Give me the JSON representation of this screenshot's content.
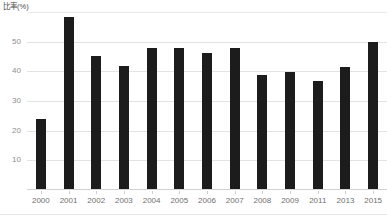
{
  "chart_data": {
    "type": "bar",
    "title": "",
    "subtitle": "",
    "xlabel": "",
    "ylabel": "比率(%)",
    "categories": [
      "2000",
      "2001",
      "2002",
      "2003",
      "2004",
      "2005",
      "2006",
      "2007",
      "2008",
      "2009",
      "2011",
      "2013",
      "2015"
    ],
    "values": [
      23.5,
      58.0,
      45.0,
      41.5,
      47.5,
      47.5,
      46.0,
      47.5,
      38.5,
      39.5,
      36.5,
      41.0,
      49.5
    ],
    "series": [
      {
        "name": "比率(%)",
        "values": [
          23.5,
          58.0,
          45.0,
          41.5,
          47.5,
          47.5,
          46.0,
          47.5,
          38.5,
          39.5,
          36.5,
          41.0,
          49.5
        ]
      }
    ],
    "ylim": [
      0,
      60
    ],
    "xlim": [
      0,
      13
    ],
    "y_ticks": [
      10,
      20,
      30,
      40,
      50
    ],
    "y_tick_labels": [
      "10",
      "20",
      "30",
      "40",
      "50"
    ],
    "grid": "horizontal",
    "legend": "none",
    "bar_color": "#1c1c1c",
    "gridline_color": "#e3e3e3",
    "background_color": "#ffffff",
    "annotations": []
  },
  "axis": {
    "y_title": "比率(%)",
    "y_ticks": [
      {
        "label": "50",
        "value": 50
      },
      {
        "label": "40",
        "value": 40
      },
      {
        "label": "30",
        "value": 30
      },
      {
        "label": "20",
        "value": 20
      },
      {
        "label": "10",
        "value": 10
      }
    ],
    "x_ticks": [
      {
        "label": "2000",
        "value": 23.5
      },
      {
        "label": "2001",
        "value": 58.0
      },
      {
        "label": "2002",
        "value": 45.0
      },
      {
        "label": "2003",
        "value": 41.5
      },
      {
        "label": "2004",
        "value": 47.5
      },
      {
        "label": "2005",
        "value": 47.5
      },
      {
        "label": "2006",
        "value": 46.0
      },
      {
        "label": "2007",
        "value": 47.5
      },
      {
        "label": "2008",
        "value": 38.5
      },
      {
        "label": "2009",
        "value": 39.5
      },
      {
        "label": "2011",
        "value": 36.5
      },
      {
        "label": "2013",
        "value": 41.0
      },
      {
        "label": "2015",
        "value": 49.5
      }
    ]
  }
}
